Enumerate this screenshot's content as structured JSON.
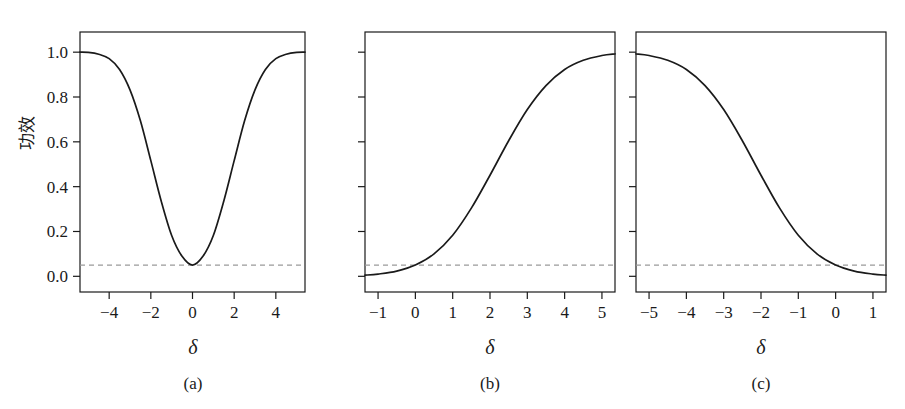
{
  "figure": {
    "y_axis_label": "功效",
    "x_axis_symbol": "δ",
    "alpha_reference": 0.05
  },
  "panels": [
    {
      "id": "a",
      "caption": "(a)",
      "x_axis_symbol": "δ",
      "xticks": [
        "-4",
        "-2",
        "0",
        "2",
        "4"
      ],
      "xtick_values": [
        -4,
        -2,
        0,
        2,
        4
      ],
      "yticks": [
        "0.0",
        "0.2",
        "0.4",
        "0.6",
        "0.8",
        "1.0"
      ],
      "ytick_values": [
        0.0,
        0.2,
        0.4,
        0.6,
        0.8,
        1.0
      ],
      "show_ylabels": true
    },
    {
      "id": "b",
      "caption": "(b)",
      "x_axis_symbol": "δ",
      "xticks": [
        "-1",
        "0",
        "1",
        "2",
        "3",
        "4",
        "5"
      ],
      "xtick_values": [
        -1,
        0,
        1,
        2,
        3,
        4,
        5
      ],
      "yticks": [
        "",
        "",
        "",
        "",
        "",
        ""
      ],
      "ytick_values": [
        0.0,
        0.2,
        0.4,
        0.6,
        0.8,
        1.0
      ],
      "show_ylabels": false
    },
    {
      "id": "c",
      "caption": "(c)",
      "x_axis_symbol": "δ",
      "xticks": [
        "-5",
        "-4",
        "-3",
        "-2",
        "-1",
        "0",
        "1"
      ],
      "xtick_values": [
        -5,
        -4,
        -3,
        -2,
        -1,
        0,
        1
      ],
      "yticks": [
        "",
        "",
        "",
        "",
        "",
        ""
      ],
      "ytick_values": [
        0.0,
        0.2,
        0.4,
        0.6,
        0.8,
        1.0
      ],
      "show_ylabels": false
    }
  ],
  "chart_data": [
    {
      "type": "line",
      "title": "",
      "panel": "(a)",
      "xlabel": "δ",
      "ylabel": "功效",
      "xlim": [
        -5.4,
        5.4
      ],
      "ylim": [
        -0.07,
        1.09
      ],
      "grid": false,
      "legend": "none",
      "annotations": [
        {
          "kind": "hline",
          "label": "alpha = 0.05",
          "y": 0.05,
          "style": "dashed",
          "color": "#9a9a9a"
        }
      ],
      "series": [
        {
          "name": "two-sided power",
          "x": [
            -5.4,
            -5.0,
            -4.5,
            -4.0,
            -3.5,
            -3.0,
            -2.5,
            -2.0,
            -1.5,
            -1.0,
            -0.5,
            0.0,
            0.5,
            1.0,
            1.5,
            2.0,
            2.5,
            3.0,
            3.5,
            4.0,
            4.5,
            5.0,
            5.4
          ],
          "y": [
            1.0,
            0.999,
            0.991,
            0.971,
            0.923,
            0.832,
            0.694,
            0.516,
            0.335,
            0.182,
            0.089,
            0.05,
            0.089,
            0.182,
            0.335,
            0.516,
            0.694,
            0.832,
            0.923,
            0.971,
            0.991,
            0.999,
            1.0
          ]
        }
      ]
    },
    {
      "type": "line",
      "title": "",
      "panel": "(b)",
      "xlabel": "δ",
      "ylabel": "",
      "xlim": [
        -1.35,
        5.35
      ],
      "ylim": [
        -0.07,
        1.09
      ],
      "grid": false,
      "legend": "none",
      "annotations": [
        {
          "kind": "hline",
          "label": "alpha = 0.05",
          "y": 0.05,
          "style": "dashed",
          "color": "#9a9a9a"
        }
      ],
      "series": [
        {
          "name": "one-sided upper power",
          "x": [
            -1.35,
            -1.0,
            -0.5,
            0.0,
            0.5,
            1.0,
            1.5,
            2.0,
            2.5,
            3.0,
            3.5,
            4.0,
            4.5,
            5.0,
            5.35
          ],
          "y": [
            0.005,
            0.01,
            0.023,
            0.05,
            0.1,
            0.183,
            0.304,
            0.451,
            0.605,
            0.744,
            0.851,
            0.923,
            0.964,
            0.985,
            0.992
          ]
        }
      ]
    },
    {
      "type": "line",
      "title": "",
      "panel": "(c)",
      "xlabel": "δ",
      "ylabel": "",
      "xlim": [
        -5.35,
        1.35
      ],
      "ylim": [
        -0.07,
        1.09
      ],
      "grid": false,
      "legend": "none",
      "annotations": [
        {
          "kind": "hline",
          "label": "alpha = 0.05",
          "y": 0.05,
          "style": "dashed",
          "color": "#9a9a9a"
        }
      ],
      "series": [
        {
          "name": "one-sided lower power",
          "x": [
            -5.35,
            -5.0,
            -4.5,
            -4.0,
            -3.5,
            -3.0,
            -2.5,
            -2.0,
            -1.5,
            -1.0,
            -0.5,
            0.0,
            0.5,
            1.0,
            1.35
          ],
          "y": [
            0.992,
            0.985,
            0.964,
            0.923,
            0.851,
            0.744,
            0.605,
            0.451,
            0.304,
            0.183,
            0.1,
            0.05,
            0.023,
            0.01,
            0.005
          ]
        }
      ]
    }
  ]
}
